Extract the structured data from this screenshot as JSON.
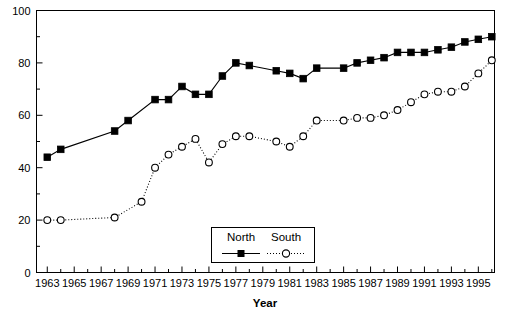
{
  "chart_data": {
    "type": "line",
    "title": "",
    "xlabel": "Year",
    "ylabel": "",
    "xlim": [
      1962.2,
      1996.2
    ],
    "ylim": [
      0,
      100
    ],
    "grid": false,
    "legend_position": "bottom-center",
    "x_major_ticks": [
      1963,
      1965,
      1967,
      1969,
      1971,
      1973,
      1975,
      1977,
      1979,
      1981,
      1983,
      1985,
      1987,
      1989,
      1991,
      1993,
      1995
    ],
    "x_minor_ticks": [
      1964,
      1966,
      1968,
      1970,
      1972,
      1974,
      1976,
      1978,
      1980,
      1982,
      1984,
      1986,
      1988,
      1990,
      1992,
      1994,
      1996
    ],
    "x_tick_labels": [
      "1963",
      "1965",
      "1967",
      "1969",
      "1971",
      "1973",
      "1975",
      "1977",
      "1979",
      "1981",
      "1983",
      "1985",
      "1987",
      "1989",
      "1991",
      "1993",
      "1995"
    ],
    "y_major_ticks": [
      0,
      20,
      40,
      60,
      80,
      100
    ],
    "y_minor_ticks": [
      10,
      30,
      50,
      70,
      90
    ],
    "y_tick_labels": [
      "0",
      "20",
      "40",
      "60",
      "80",
      "100"
    ],
    "series": [
      {
        "name": "North",
        "marker": "filled-square",
        "line_style": "solid",
        "color": "#000000",
        "x": [
          1963,
          1964,
          1968,
          1969,
          1971,
          1972,
          1973,
          1974,
          1975,
          1976,
          1977,
          1978,
          1980,
          1981,
          1982,
          1983,
          1985,
          1986,
          1987,
          1988,
          1989,
          1990,
          1991,
          1992,
          1993,
          1994,
          1995,
          1996
        ],
        "values": [
          44,
          47,
          54,
          58,
          66,
          66,
          71,
          68,
          68,
          75,
          80,
          79,
          77,
          76,
          74,
          78,
          78,
          80,
          81,
          82,
          84,
          84,
          84,
          85,
          86,
          88,
          89,
          90
        ]
      },
      {
        "name": "South",
        "marker": "open-circle",
        "line_style": "dotted",
        "color": "#000000",
        "x": [
          1963,
          1964,
          1968,
          1970,
          1971,
          1972,
          1973,
          1974,
          1975,
          1976,
          1977,
          1978,
          1980,
          1981,
          1982,
          1983,
          1985,
          1986,
          1987,
          1988,
          1989,
          1990,
          1991,
          1992,
          1993,
          1994,
          1995,
          1996
        ],
        "values": [
          20,
          20,
          21,
          27,
          40,
          45,
          48,
          51,
          42,
          49,
          52,
          52,
          50,
          48,
          52,
          58,
          58,
          59,
          59,
          60,
          62,
          65,
          68,
          69,
          69,
          71,
          76,
          81
        ]
      }
    ]
  },
  "legend": {
    "entries": [
      {
        "label": "North",
        "marker": "filled-square",
        "line_style": "solid"
      },
      {
        "label": "South",
        "marker": "open-circle",
        "line_style": "dotted"
      }
    ]
  },
  "axis": {
    "x_title": "Year"
  }
}
